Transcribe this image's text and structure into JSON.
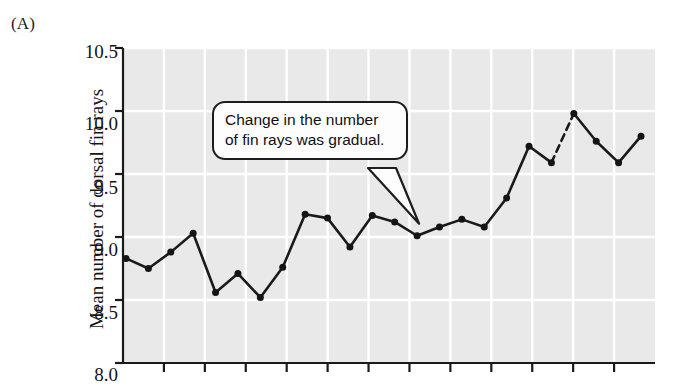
{
  "figure": {
    "panel_label": "(A)"
  },
  "callout": {
    "line1": "Change in the number",
    "line2": "of fin rays was gradual."
  },
  "colors": {
    "page_background": "#ffffff",
    "plot_background": "#e9e9e9",
    "gridline": "#ffffff",
    "axis": "#1a1a1a",
    "series_line": "#1a1a1a",
    "marker": "#141414",
    "callout_border": "#1d1d1d",
    "callout_fill": "#fdfdfd",
    "text": "#141414"
  },
  "chart_data": {
    "type": "line",
    "title": "",
    "xlabel": "",
    "ylabel": "Mean number of dorsal fin rays",
    "ylim": [
      8.0,
      10.5
    ],
    "yticks": [
      8.0,
      8.5,
      9.0,
      9.5,
      10.0,
      10.5
    ],
    "ytick_labels": [
      "8.0",
      "8.5",
      "9.0",
      "9.5",
      "10.0",
      "10.5"
    ],
    "xlim": [
      0,
      24
    ],
    "xtick_count": 12,
    "xtick_labels": [],
    "grid": true,
    "legend": false,
    "markers": "filled-circle",
    "series": [
      {
        "name": "Mean number of dorsal fin rays",
        "x": [
          0,
          1,
          2,
          3,
          4,
          5,
          6,
          7,
          8,
          9,
          10,
          11,
          12,
          13,
          14,
          15,
          16,
          17,
          18,
          19,
          20,
          21,
          22,
          23
        ],
        "values": [
          8.83,
          8.75,
          8.88,
          9.03,
          8.56,
          8.71,
          8.52,
          8.76,
          9.18,
          9.15,
          8.92,
          9.17,
          9.12,
          9.01,
          9.08,
          9.14,
          9.08,
          9.31,
          9.72,
          9.59,
          9.98,
          9.76,
          9.59,
          9.8
        ]
      }
    ],
    "dashed_segments": [
      {
        "from_index": 19,
        "to_index": 20,
        "note": "gap in sampling drawn as dashed line"
      }
    ],
    "annotations": [
      {
        "text": "Change in the number of fin rays was gradual.",
        "type": "callout",
        "points_to_index": 13
      }
    ]
  }
}
